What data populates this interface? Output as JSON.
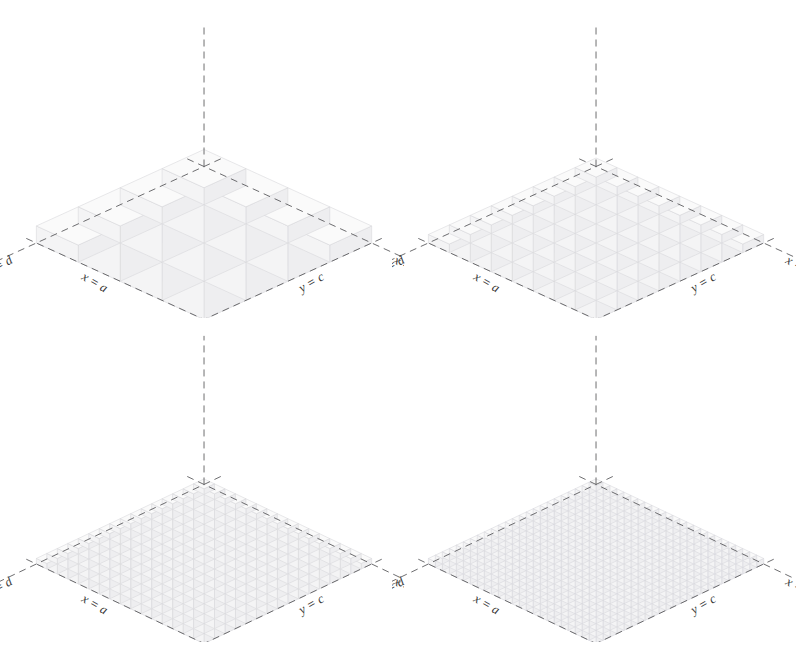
{
  "figure": {
    "caption_fragment": "",
    "background": "#ffffff",
    "panel_count": 4
  },
  "style": {
    "block_fill": "#f4f4f5",
    "block_edge": "#d8d8dc",
    "block_top_fill": "#fafafa",
    "block_side_fill": "#eeeef0",
    "axis_color": "#555558",
    "label_color": "#3a3a3a",
    "axis_dash": "7,5"
  },
  "labels": {
    "x_a": "x = a",
    "x_b": "x = b",
    "y_c": "y = c",
    "y_d": "y = d"
  },
  "chart_data": {
    "type": "bar",
    "title": "",
    "subtitle": "",
    "xlabel": "x",
    "ylabel": "y",
    "zlabel": "z",
    "projection": "isometric-3d",
    "grid": true,
    "legend": false,
    "axis_ticks": [
      "x = a",
      "x = b",
      "y = c",
      "y = d"
    ],
    "panels": [
      {
        "index": 1,
        "position": "top-left",
        "nx": 4,
        "ny": 4,
        "max_height_units": 4,
        "surface": "f(x,y) increases toward the back corner (x=b, y=d)",
        "heights": [
          [
            1,
            1,
            1,
            1
          ],
          [
            1,
            2,
            2,
            2
          ],
          [
            1,
            2,
            3,
            3
          ],
          [
            1,
            2,
            3,
            4
          ]
        ]
      },
      {
        "index": 2,
        "position": "top-right",
        "nx": 8,
        "ny": 8,
        "max_height_units": 8,
        "surface": "f(x,y) increases toward the back corner (x=b, y=d)",
        "heights": [
          [
            1,
            1,
            1,
            1,
            1,
            1,
            1,
            1
          ],
          [
            1,
            2,
            2,
            2,
            2,
            2,
            2,
            2
          ],
          [
            1,
            2,
            3,
            3,
            3,
            3,
            3,
            3
          ],
          [
            1,
            2,
            3,
            4,
            4,
            4,
            4,
            4
          ],
          [
            1,
            2,
            3,
            4,
            5,
            5,
            5,
            5
          ],
          [
            1,
            2,
            3,
            4,
            5,
            6,
            6,
            6
          ],
          [
            1,
            2,
            3,
            4,
            5,
            6,
            7,
            7
          ],
          [
            1,
            2,
            3,
            4,
            5,
            6,
            7,
            8
          ]
        ]
      },
      {
        "index": 3,
        "position": "bottom-left",
        "nx": 16,
        "ny": 16,
        "max_height_units": 16,
        "surface": "f(x,y) increases toward the back corner (x=b, y=d)"
      },
      {
        "index": 4,
        "position": "bottom-right",
        "nx": 24,
        "ny": 24,
        "max_height_units": 24,
        "surface": "f(x,y) increases toward the back corner (x=b, y=d)"
      }
    ]
  }
}
